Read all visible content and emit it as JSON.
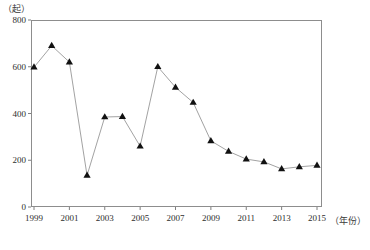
{
  "chart_data": {
    "type": "line",
    "title": "",
    "subtitle": "",
    "xlabel": "（年份）",
    "ylabel": "（起）",
    "ylim": [
      0,
      800
    ],
    "xlim": [
      1999,
      2015
    ],
    "grid": false,
    "legend": null,
    "marker": "triangle-up",
    "marker_color": "#111111",
    "line_color": "#8a8a8a",
    "x": [
      1999,
      2000,
      2001,
      2002,
      2003,
      2004,
      2005,
      2006,
      2007,
      2008,
      2009,
      2010,
      2011,
      2012,
      2013,
      2014,
      2015
    ],
    "values": [
      598,
      690,
      620,
      135,
      385,
      387,
      260,
      600,
      512,
      447,
      283,
      238,
      205,
      193,
      163,
      172,
      178
    ],
    "series": [
      {
        "name": "事故起数",
        "values": [
          598,
          690,
          620,
          135,
          385,
          387,
          260,
          600,
          512,
          447,
          283,
          238,
          205,
          193,
          163,
          172,
          178
        ]
      }
    ],
    "y_ticks": [
      0,
      200,
      400,
      600,
      800
    ],
    "y_tick_labels": [
      "0",
      "200",
      "400",
      "600",
      "800"
    ],
    "x_ticks": [
      1999,
      2001,
      2003,
      2005,
      2007,
      2009,
      2011,
      2013,
      2015
    ],
    "x_tick_labels": [
      "1999",
      "2001",
      "2003",
      "2005",
      "2007",
      "2009",
      "2011",
      "2013",
      "2015"
    ]
  },
  "axes": {
    "y_unit_label": "（起）",
    "x_unit_label": "（年份）"
  }
}
